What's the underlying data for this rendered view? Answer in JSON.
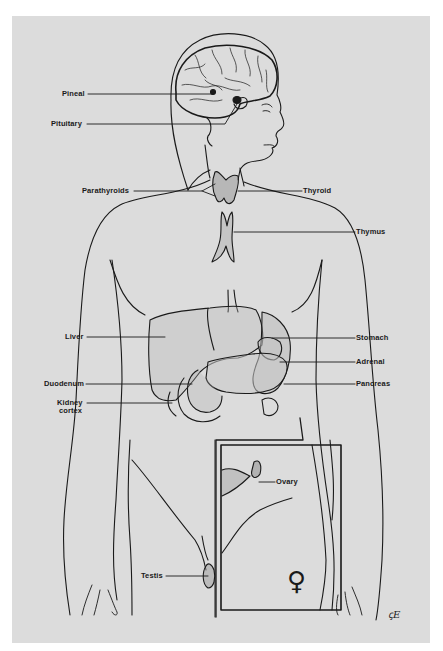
{
  "figure": {
    "background_color": "#dcdcdc",
    "line_color": "#1a1a1a"
  },
  "labels": {
    "pineal": "Pineal",
    "pituitary": "Pituitary",
    "parathyroids": "Parathyroids",
    "thyroid": "Thyroid",
    "thymus": "Thymus",
    "liver": "Liver",
    "stomach": "Stomach",
    "adrenal": "Adrenal",
    "duodenum": "Duodenum",
    "pancreas": "Pancreas",
    "kidney_cortex_line1": "Kidney",
    "kidney_cortex_line2": "cortex",
    "ovary": "Ovary",
    "testis": "Testis"
  },
  "inset": {
    "symbol": "♀",
    "symbol_name": "female-symbol"
  },
  "signature": "ꞔE"
}
